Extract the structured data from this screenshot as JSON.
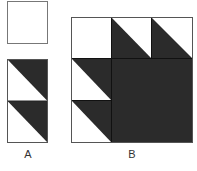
{
  "figure": {
    "labels": {
      "a": "A",
      "b": "B"
    },
    "colors": {
      "dark": "#2b2b2b",
      "light": "#ffffff",
      "stroke": "#555555"
    },
    "part_a": {
      "pieces": [
        {
          "name": "plain-square",
          "type": "square",
          "fill": "light"
        },
        {
          "name": "triangle-strip",
          "type": "two half-square triangles stacked",
          "dark_side": "upper-right"
        }
      ]
    },
    "part_b": {
      "grid": "3x3",
      "cells": [
        [
          "light-square",
          "hst-dark-lower-left",
          "hst-dark-lower-left"
        ],
        [
          "hst-dark-upper-right",
          "dark",
          "dark"
        ],
        [
          "hst-dark-upper-right",
          "dark",
          "dark"
        ]
      ]
    }
  }
}
